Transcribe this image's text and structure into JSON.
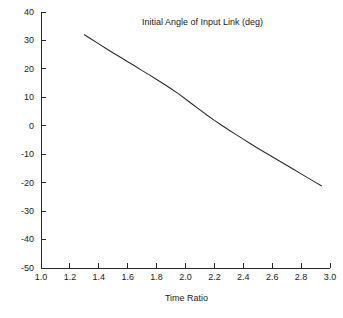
{
  "chart_data": {
    "type": "line",
    "title": "Initial Angle of Input Link (deg)",
    "xlabel": "Time Ratio",
    "ylabel": "",
    "xlim": [
      1.0,
      3.0
    ],
    "ylim": [
      -50,
      40
    ],
    "grid": false,
    "legend": null,
    "xticks": [
      "1.0",
      "1.2",
      "1.4",
      "1.6",
      "1.8",
      "2.0",
      "2.2",
      "2.4",
      "2.6",
      "2.8",
      "3.0"
    ],
    "xtick_values": [
      1.0,
      1.2,
      1.4,
      1.6,
      1.8,
      2.0,
      2.2,
      2.4,
      2.6,
      2.8,
      3.0
    ],
    "yticks": [
      "40",
      "30",
      "20",
      "10",
      "0",
      "-10",
      "-20",
      "-30",
      "-40",
      "-50"
    ],
    "ytick_values": [
      40,
      30,
      20,
      10,
      0,
      -10,
      -20,
      -30,
      -40,
      -50
    ],
    "series": [
      {
        "name": "Initial Angle of Input Link",
        "color": "#2b2b2b",
        "x": [
          1.3,
          1.35,
          1.4,
          1.45,
          1.5,
          1.55,
          1.6,
          1.65,
          1.7,
          1.75,
          1.8,
          1.85,
          1.9,
          1.95,
          2.0,
          2.05,
          2.1,
          2.15,
          2.2,
          2.25,
          2.3,
          2.35,
          2.4,
          2.45,
          2.5,
          2.55,
          2.6,
          2.65,
          2.7,
          2.75,
          2.8,
          2.85,
          2.9,
          2.94
        ],
        "y": [
          32.0,
          30.4,
          28.8,
          27.2,
          25.6,
          24.1,
          22.5,
          21.0,
          19.4,
          17.9,
          16.3,
          14.7,
          13.0,
          11.3,
          9.4,
          7.5,
          5.6,
          3.7,
          1.9,
          0.2,
          -1.5,
          -3.1,
          -4.7,
          -6.3,
          -7.9,
          -9.4,
          -10.9,
          -12.4,
          -13.9,
          -15.4,
          -16.9,
          -18.4,
          -19.9,
          -21.1
        ]
      }
    ],
    "annotations": []
  },
  "axis_geometry": {
    "left_px": 41,
    "right_px": 330,
    "top_px": 12,
    "bottom_px": 268
  }
}
